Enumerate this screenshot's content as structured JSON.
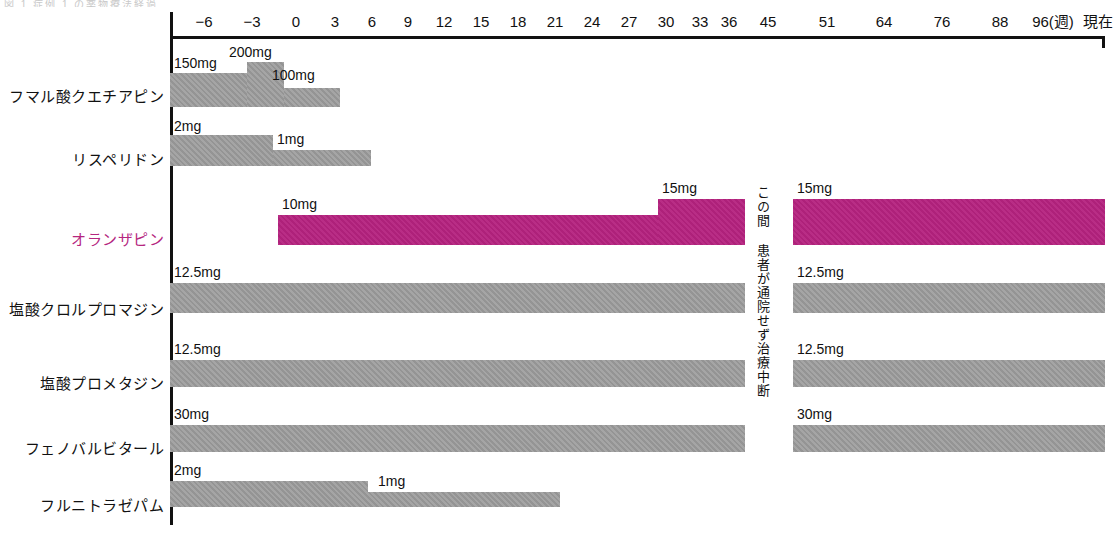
{
  "page": {
    "top_fragment": "図 1  症例 1 の薬物療法経過",
    "accent_color": "#B5227F",
    "bar_color": "#9b9b9b"
  },
  "axis": {
    "unit_label": "96(週)",
    "end_label": "現在",
    "ticks": [
      {
        "label": "−6",
        "x": 204
      },
      {
        "label": "−3",
        "x": 252
      },
      {
        "label": "0",
        "x": 296
      },
      {
        "label": "3",
        "x": 335
      },
      {
        "label": "6",
        "x": 372
      },
      {
        "label": "9",
        "x": 408
      },
      {
        "label": "12",
        "x": 444
      },
      {
        "label": "15",
        "x": 481
      },
      {
        "label": "18",
        "x": 518
      },
      {
        "label": "21",
        "x": 555
      },
      {
        "label": "24",
        "x": 592
      },
      {
        "label": "27",
        "x": 629
      },
      {
        "label": "30",
        "x": 666
      },
      {
        "label": "33",
        "x": 700
      },
      {
        "label": "36",
        "x": 729
      },
      {
        "label": "45",
        "x": 768
      },
      {
        "label": "51",
        "x": 827
      },
      {
        "label": "64",
        "x": 884
      },
      {
        "label": "76",
        "x": 942
      },
      {
        "label": "88",
        "x": 1000
      },
      {
        "label": "96(週)",
        "x": 1053
      },
      {
        "label": "現在",
        "x": 1098
      }
    ]
  },
  "gap_note": {
    "text": "この間 患者が通院せず治療中断"
  },
  "rows": [
    {
      "name": "フマル酸クエチアピン",
      "accent": false,
      "label_y": 85,
      "segments": [
        {
          "dose": "150mg",
          "x": 170,
          "width": 77,
          "y": 73,
          "height": 34,
          "dose_x": 174,
          "dose_y": 55,
          "color": "grey"
        },
        {
          "dose": "200mg",
          "x": 247,
          "width": 37,
          "y": 62,
          "height": 45,
          "dose_x": 229,
          "dose_y": 44,
          "color": "grey"
        },
        {
          "dose": "100mg",
          "x": 284,
          "width": 56,
          "y": 88,
          "height": 19,
          "dose_x": 272,
          "dose_y": 67,
          "color": "grey"
        }
      ]
    },
    {
      "name": "リスペリドン",
      "accent": false,
      "label_y": 148,
      "segments": [
        {
          "dose": "2mg",
          "x": 170,
          "width": 103,
          "y": 135,
          "height": 31,
          "dose_x": 174,
          "dose_y": 118,
          "color": "grey"
        },
        {
          "dose": "1mg",
          "x": 273,
          "width": 98,
          "y": 150,
          "height": 16,
          "dose_x": 277,
          "dose_y": 131,
          "color": "grey"
        }
      ]
    },
    {
      "name": "オランザピン",
      "accent": true,
      "label_y": 228,
      "segments": [
        {
          "dose": "10mg",
          "x": 278,
          "width": 380,
          "y": 215,
          "height": 30,
          "dose_x": 282,
          "dose_y": 196,
          "color": "magenta"
        },
        {
          "dose": "15mg",
          "x": 658,
          "width": 87,
          "y": 199,
          "height": 46,
          "dose_x": 662,
          "dose_y": 180,
          "color": "magenta"
        },
        {
          "dose": "15mg",
          "x": 793,
          "width": 312,
          "y": 199,
          "height": 46,
          "dose_x": 797,
          "dose_y": 180,
          "color": "magenta"
        }
      ]
    },
    {
      "name": "塩酸クロルプロマジン",
      "accent": false,
      "label_y": 298,
      "segments": [
        {
          "dose": "12.5mg",
          "x": 170,
          "width": 575,
          "y": 283,
          "height": 30,
          "dose_x": 174,
          "dose_y": 264,
          "color": "grey"
        },
        {
          "dose": "12.5mg",
          "x": 793,
          "width": 312,
          "y": 283,
          "height": 30,
          "dose_x": 797,
          "dose_y": 264,
          "color": "grey"
        }
      ]
    },
    {
      "name": "塩酸プロメタジン",
      "accent": false,
      "label_y": 372,
      "segments": [
        {
          "dose": "12.5mg",
          "x": 170,
          "width": 575,
          "y": 360,
          "height": 27,
          "dose_x": 174,
          "dose_y": 341,
          "color": "grey"
        },
        {
          "dose": "12.5mg",
          "x": 793,
          "width": 312,
          "y": 360,
          "height": 27,
          "dose_x": 797,
          "dose_y": 341,
          "color": "grey"
        }
      ]
    },
    {
      "name": "フェノバルビタール",
      "accent": false,
      "label_y": 437,
      "segments": [
        {
          "dose": "30mg",
          "x": 170,
          "width": 575,
          "y": 425,
          "height": 27,
          "dose_x": 174,
          "dose_y": 406,
          "color": "grey"
        },
        {
          "dose": "30mg",
          "x": 793,
          "width": 312,
          "y": 425,
          "height": 27,
          "dose_x": 797,
          "dose_y": 406,
          "color": "grey"
        }
      ]
    },
    {
      "name": "フルニトラゼパム",
      "accent": false,
      "label_y": 494,
      "segments": [
        {
          "dose": "2mg",
          "x": 170,
          "width": 198,
          "y": 481,
          "height": 26,
          "dose_x": 174,
          "dose_y": 462,
          "color": "grey"
        },
        {
          "dose": "1mg",
          "x": 368,
          "width": 192,
          "y": 492,
          "height": 15,
          "dose_x": 378,
          "dose_y": 473,
          "color": "grey"
        }
      ]
    }
  ],
  "chart_data": {
    "type": "bar",
    "title": "",
    "xlabel": "週",
    "ylabel": "",
    "orientation": "horizontal-timeline",
    "x_ticks": [
      "−6",
      "−3",
      "0",
      "3",
      "6",
      "9",
      "12",
      "15",
      "18",
      "21",
      "24",
      "27",
      "30",
      "33",
      "36",
      "45",
      "51",
      "64",
      "76",
      "88",
      "96(週)",
      "現在"
    ],
    "x_note": "軸目盛りは非等間隔（45週以降は圧縮表示）",
    "annotations": [
      "この間 患者が通院せず治療中断"
    ],
    "series": [
      {
        "name": "フマル酸クエチアピン",
        "color": "#9b9b9b",
        "segments": [
          {
            "dose_mg": 150,
            "label": "150mg",
            "start_week": -8,
            "end_week": -3
          },
          {
            "dose_mg": 200,
            "label": "200mg",
            "start_week": -3,
            "end_week": 0
          },
          {
            "dose_mg": 100,
            "label": "100mg",
            "start_week": 0,
            "end_week": 4.5
          }
        ]
      },
      {
        "name": "リスペリドン",
        "color": "#9b9b9b",
        "segments": [
          {
            "dose_mg": 2,
            "label": "2mg",
            "start_week": -8,
            "end_week": -1.5
          },
          {
            "dose_mg": 1,
            "label": "1mg",
            "start_week": -1.5,
            "end_week": 6.5
          }
        ]
      },
      {
        "name": "オランザピン",
        "color": "#B5227F",
        "highlighted": true,
        "segments": [
          {
            "dose_mg": 10,
            "label": "10mg",
            "start_week": -0.5,
            "end_week": 31
          },
          {
            "dose_mg": 15,
            "label": "15mg",
            "start_week": 31,
            "end_week": 45
          },
          {
            "dose_mg": 15,
            "label": "15mg",
            "start_week": 51,
            "end_week": 96
          }
        ]
      },
      {
        "name": "塩酸クロルプロマジン",
        "color": "#9b9b9b",
        "segments": [
          {
            "dose_mg": 12.5,
            "label": "12.5mg",
            "start_week": -8,
            "end_week": 45
          },
          {
            "dose_mg": 12.5,
            "label": "12.5mg",
            "start_week": 51,
            "end_week": 96
          }
        ]
      },
      {
        "name": "塩酸プロメタジン",
        "color": "#9b9b9b",
        "segments": [
          {
            "dose_mg": 12.5,
            "label": "12.5mg",
            "start_week": -8,
            "end_week": 45
          },
          {
            "dose_mg": 12.5,
            "label": "12.5mg",
            "start_week": 51,
            "end_week": 96
          }
        ]
      },
      {
        "name": "フェノバルビタール",
        "color": "#9b9b9b",
        "segments": [
          {
            "dose_mg": 30,
            "label": "30mg",
            "start_week": -8,
            "end_week": 45
          },
          {
            "dose_mg": 30,
            "label": "30mg",
            "start_week": 51,
            "end_week": 96
          }
        ]
      },
      {
        "name": "フルニトラゼパム",
        "color": "#9b9b9b",
        "segments": [
          {
            "dose_mg": 2,
            "label": "2mg",
            "start_week": -8,
            "end_week": 9
          },
          {
            "dose_mg": 1,
            "label": "1mg",
            "start_week": 9,
            "end_week": 24
          }
        ]
      }
    ]
  }
}
